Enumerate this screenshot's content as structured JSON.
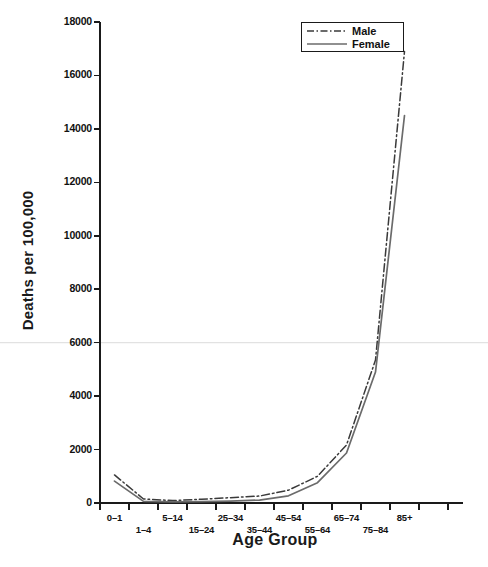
{
  "chart_data": {
    "type": "line",
    "title": "",
    "xlabel": "Age Group",
    "ylabel": "Deaths per 100,000",
    "categories": [
      "0–1",
      "1–4",
      "5–14",
      "15–24",
      "25–34",
      "35–44",
      "45–54",
      "55–64",
      "65–74",
      "75–84",
      "85+"
    ],
    "series": [
      {
        "name": "Male",
        "style": "dash-dot",
        "color": "#3a3a3a",
        "values": [
          1050,
          150,
          90,
          140,
          200,
          260,
          480,
          1000,
          2170,
          5350,
          16900
        ]
      },
      {
        "name": "Female",
        "style": "solid",
        "color": "#6b6b6b",
        "values": [
          820,
          60,
          40,
          50,
          70,
          110,
          270,
          760,
          1870,
          4900,
          14500
        ]
      }
    ],
    "ylim": [
      0,
      18000
    ],
    "yticks": [
      0,
      2000,
      4000,
      6000,
      8000,
      10000,
      12000,
      14000,
      16000,
      18000
    ],
    "ytick_labels": [
      "0",
      "2000",
      "4000",
      "6000",
      "8000",
      "10000",
      "12000",
      "14000",
      "16000",
      "18000"
    ],
    "grid": false,
    "legend_position": "top-right"
  },
  "axes": {
    "y_title": "Deaths per 100,000",
    "x_title": "Age Group"
  },
  "legend": {
    "entries": [
      {
        "label": "Male",
        "style": "dash-dot"
      },
      {
        "label": "Female",
        "style": "solid"
      }
    ]
  },
  "colors": {
    "male_line": "#3a3a3a",
    "female_line": "#6b6b6b",
    "axis": "#1a1a1a",
    "text": "#111111",
    "background": "#ffffff",
    "artifact_line": "#e2e2e2"
  }
}
